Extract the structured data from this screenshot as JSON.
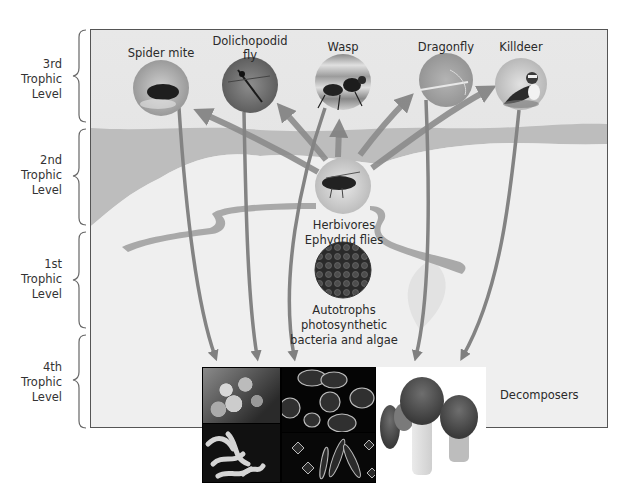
{
  "diagram": {
    "levels": [
      {
        "label": "3rd\nTrophic\nLevel",
        "line1": "3rd",
        "line2": "Trophic",
        "line3": "Level"
      },
      {
        "label": "2nd\nTrophic\nLevel",
        "line1": "2nd",
        "line2": "Trophic",
        "line3": "Level"
      },
      {
        "label": "1st\nTrophic\nLevel",
        "line1": "1st",
        "line2": "Trophic",
        "line3": "Level"
      },
      {
        "label": "4th\nTrophic\nLevel",
        "line1": "4th",
        "line2": "Trophic",
        "line3": "Level"
      }
    ],
    "predators": [
      {
        "name": "Spider mite",
        "line1": "Spider mite",
        "line2": ""
      },
      {
        "name": "Dolichopodid fly",
        "line1": "Dolichopodid",
        "line2": "fly"
      },
      {
        "name": "Wasp",
        "line1": "Wasp",
        "line2": ""
      },
      {
        "name": "Dragonfly",
        "line1": "Dragonfly",
        "line2": ""
      },
      {
        "name": "Killdeer",
        "line1": "Killdeer",
        "line2": ""
      }
    ],
    "herbivores": {
      "line1": "Herbivores",
      "line2": "Ephydrid flies"
    },
    "autotrophs": {
      "line1": "Autotrophs",
      "line2": "photosynthetic",
      "line3": "bacteria and algae"
    },
    "decomposers": {
      "label": "Decomposers"
    },
    "colors": {
      "panel_bg": "#e6e6e6",
      "band_dark": "#b8b8b8",
      "band_light": "#f1f1f1",
      "arrow": "#8a8a8a",
      "border": "#555555"
    }
  }
}
